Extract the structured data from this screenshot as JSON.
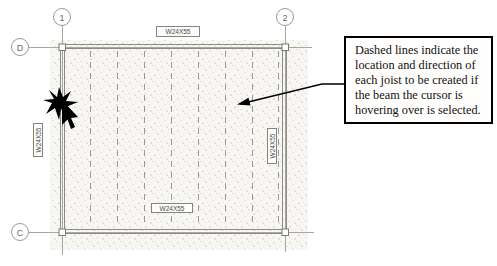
{
  "grids": {
    "columns": [
      {
        "label": "1"
      },
      {
        "label": "2"
      }
    ],
    "rows": [
      {
        "label": "D"
      },
      {
        "label": "C"
      }
    ]
  },
  "beams": {
    "top_label": "W24X55",
    "bottom_label": "W24X55",
    "left_label": "W24X55",
    "right_label": "W24X55"
  },
  "joists": {
    "count": 8,
    "style": "dashed-preview"
  },
  "callout": {
    "text": "Dashed lines indicate the location and direction of each joist to be created if the beam the cursor is hovering over is selected."
  },
  "colors": {
    "background": "#ffffff",
    "slab_fill": "#f8f7f4",
    "stipple_dot": "#bdbab2",
    "grid_line": "#a8a8a3",
    "beam_line": "#8c8c86",
    "joist_line": "#9b9993",
    "annotation": "#000000"
  },
  "icons": {
    "cursor": "snap-cursor"
  }
}
